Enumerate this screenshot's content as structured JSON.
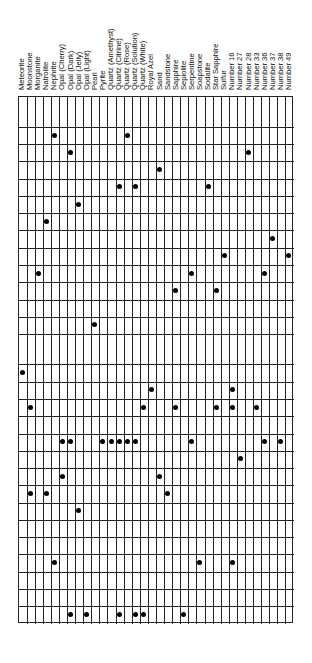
{
  "chart_data": {
    "type": "table",
    "subtype": "dot-matrix",
    "title": "",
    "xlabel": "",
    "ylabel": "",
    "grid": true,
    "legend": null,
    "columns": [
      "Meteorite",
      "Moonstone",
      "Morganite",
      "Natrolite",
      "Nephrite",
      "Opal (Cherry)",
      "Opal (Dark)",
      "Opal (Jelly)",
      "Opal (Light)",
      "Pearl",
      "Pyrite",
      "Quartz (Amethyst)",
      "Quartz (Citrine)",
      "Quartz (Rose)",
      "Quartz (Solution)",
      "Quartz (White)",
      "Royal Azel",
      "Sand",
      "Sandstone",
      "Sapphire",
      "Sepiolite",
      "Serpentine",
      "Soapstone",
      "Sodalite",
      "Star Sapphire",
      "Sulfur",
      "Number 16",
      "Number 27",
      "Number 28",
      "Number 33",
      "Number 36",
      "Number 37",
      "Number 38",
      "Number 49"
    ],
    "row_count": 29,
    "tall_rows": [
      0,
      13
    ],
    "rows": [
      {
        "row": 0,
        "marked": []
      },
      {
        "row": 1,
        "marked": [
          "Nephrite",
          "Quartz (Rose)"
        ]
      },
      {
        "row": 2,
        "marked": [
          "Opal (Dark)",
          "Number 28"
        ]
      },
      {
        "row": 3,
        "marked": [
          "Sand"
        ]
      },
      {
        "row": 4,
        "marked": [
          "Quartz (Citrine)",
          "Quartz (Solution)",
          "Sodalite"
        ]
      },
      {
        "row": 5,
        "marked": [
          "Opal (Jelly)"
        ]
      },
      {
        "row": 6,
        "marked": [
          "Natrolite"
        ]
      },
      {
        "row": 7,
        "marked": [
          "Number 37"
        ]
      },
      {
        "row": 8,
        "marked": [
          "Sulfur",
          "Number 49"
        ]
      },
      {
        "row": 9,
        "marked": [
          "Morganite",
          "Serpentine",
          "Number 36"
        ]
      },
      {
        "row": 10,
        "marked": [
          "Sapphire",
          "Star Sapphire"
        ]
      },
      {
        "row": 11,
        "marked": []
      },
      {
        "row": 12,
        "marked": [
          "Pearl"
        ]
      },
      {
        "row": 13,
        "marked": []
      },
      {
        "row": 14,
        "marked": [
          "Meteorite"
        ]
      },
      {
        "row": 15,
        "marked": [
          "Royal Azel",
          "Number 16"
        ]
      },
      {
        "row": 16,
        "marked": [
          "Moonstone",
          "Quartz (White)",
          "Sapphire",
          "Star Sapphire",
          "Number 16",
          "Number 33"
        ]
      },
      {
        "row": 17,
        "marked": []
      },
      {
        "row": 18,
        "marked": [
          "Opal (Cherry)",
          "Opal (Dark)",
          "Pyrite",
          "Quartz (Amethyst)",
          "Quartz (Citrine)",
          "Quartz (Rose)",
          "Quartz (Solution)",
          "Serpentine",
          "Number 36",
          "Number 38"
        ]
      },
      {
        "row": 19,
        "marked": [
          "Number 27"
        ]
      },
      {
        "row": 20,
        "marked": [
          "Opal (Cherry)",
          "Sand"
        ]
      },
      {
        "row": 21,
        "marked": [
          "Moonstone",
          "Natrolite",
          "Sandstone"
        ]
      },
      {
        "row": 22,
        "marked": [
          "Opal (Jelly)"
        ]
      },
      {
        "row": 23,
        "marked": []
      },
      {
        "row": 24,
        "marked": []
      },
      {
        "row": 25,
        "marked": [
          "Nephrite",
          "Soapstone",
          "Number 16"
        ]
      },
      {
        "row": 26,
        "marked": []
      },
      {
        "row": 27,
        "marked": []
      },
      {
        "row": 28,
        "marked": [
          "Opal (Dark)",
          "Opal (Light)",
          "Quartz (Citrine)",
          "Quartz (Solution)",
          "Quartz (White)",
          "Sepiolite"
        ]
      }
    ]
  },
  "dots_by_row_index": [
    [],
    [
      4,
      13
    ],
    [
      6,
      28
    ],
    [
      17
    ],
    [
      12,
      14,
      23
    ],
    [
      7
    ],
    [
      3
    ],
    [
      31
    ],
    [
      25,
      33
    ],
    [
      2,
      21,
      30
    ],
    [
      19,
      24
    ],
    [],
    [
      9
    ],
    [],
    [
      0
    ],
    [
      16,
      26
    ],
    [
      1,
      15,
      19,
      24,
      26,
      29
    ],
    [],
    [
      5,
      6,
      10,
      11,
      12,
      13,
      14,
      21,
      30,
      32
    ],
    [
      27
    ],
    [
      5,
      17
    ],
    [
      1,
      3,
      18
    ],
    [
      7
    ],
    [],
    [],
    [
      4,
      22,
      26
    ],
    [],
    [],
    [
      6,
      8,
      12,
      14,
      15,
      20
    ]
  ],
  "colors": {
    "background": "#ffffff",
    "grid_line": "#222222",
    "dot": "#000000",
    "label_text": "#111111"
  }
}
